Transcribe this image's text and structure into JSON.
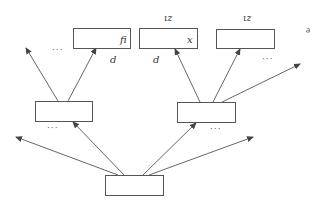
{
  "diagram": {
    "type": "tree",
    "colors": {
      "stroke": "#555555",
      "text": "#333333",
      "background": "#ffffff"
    },
    "nodes": [
      {
        "id": "root",
        "label": "",
        "x": 105,
        "y": 175,
        "w": 58,
        "h": 20
      },
      {
        "id": "mid_left",
        "label": "",
        "x": 35,
        "y": 101,
        "w": 57,
        "h": 20
      },
      {
        "id": "mid_right",
        "label": "",
        "x": 177,
        "y": 102,
        "w": 58,
        "h": 20
      },
      {
        "id": "top_1",
        "label": "fi",
        "x": 73,
        "y": 28,
        "w": 57,
        "h": 20
      },
      {
        "id": "top_2",
        "label": "x",
        "x": 139,
        "y": 28,
        "w": 58,
        "h": 20
      },
      {
        "id": "top_3",
        "label": "",
        "x": 216,
        "y": 29,
        "w": 58,
        "h": 19
      }
    ],
    "edges": [
      {
        "from": [
          118,
          175
        ],
        "to": [
          16,
          137
        ]
      },
      {
        "from": [
          124,
          175
        ],
        "to": [
          73,
          122
        ]
      },
      {
        "from": [
          143,
          175
        ],
        "to": [
          196,
          123
        ]
      },
      {
        "from": [
          149,
          175
        ],
        "to": [
          253,
          137
        ]
      },
      {
        "from": [
          58,
          101
        ],
        "to": [
          26,
          48
        ]
      },
      {
        "from": [
          68,
          101
        ],
        "to": [
          96,
          48
        ]
      },
      {
        "from": [
          200,
          102
        ],
        "to": [
          175,
          49
        ]
      },
      {
        "from": [
          213,
          102
        ],
        "to": [
          240,
          49
        ]
      },
      {
        "from": [
          222,
          102
        ],
        "to": [
          300,
          64
        ]
      }
    ],
    "labels": {
      "top_1_inner": "fi",
      "top_2_inner": "x",
      "below_top_1": "d",
      "below_top_2": "d",
      "above_top_2": "ιz",
      "above_top_3": "ιz",
      "right_edge": "∂"
    },
    "ellipses": [
      {
        "text": "···",
        "x": 52,
        "y": 53
      },
      {
        "text": "···",
        "x": 262,
        "y": 62
      },
      {
        "text": "···",
        "x": 47,
        "y": 131
      },
      {
        "text": "···",
        "x": 210,
        "y": 132
      }
    ]
  }
}
